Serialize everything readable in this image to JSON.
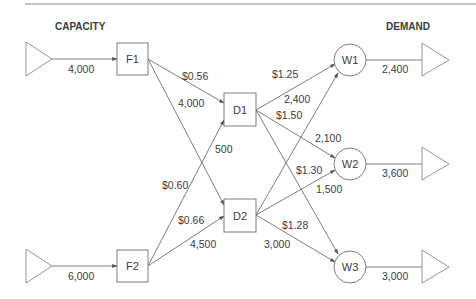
{
  "headers": {
    "capacity": "CAPACITY",
    "demand": "DEMAND"
  },
  "nodes": {
    "F1": "F1",
    "F2": "F2",
    "D1": "D1",
    "D2": "D2",
    "W1": "W1",
    "W2": "W2",
    "W3": "W3"
  },
  "supply": {
    "F1": "4,000",
    "F2": "6,000"
  },
  "demand": {
    "W1": "2,400",
    "W2": "3,600",
    "W3": "3,000"
  },
  "edges": [
    {
      "from": "F1",
      "to": "D1",
      "cost": "$0.56",
      "flow": "4,000"
    },
    {
      "from": "F1",
      "to": "D2",
      "cost": "",
      "flow": ""
    },
    {
      "from": "F2",
      "to": "D1",
      "cost": "$0.60",
      "flow": "500"
    },
    {
      "from": "F2",
      "to": "D2",
      "cost": "$0.66",
      "flow": "4,500"
    },
    {
      "from": "D1",
      "to": "W1",
      "cost": "$1.25",
      "flow": "2,400"
    },
    {
      "from": "D1",
      "to": "W2",
      "cost": "$1.50",
      "flow": "2,100"
    },
    {
      "from": "D1",
      "to": "W3",
      "cost": "",
      "flow": ""
    },
    {
      "from": "D2",
      "to": "W1",
      "cost": "",
      "flow": ""
    },
    {
      "from": "D2",
      "to": "W2",
      "cost": "$1.30",
      "flow": "1,500"
    },
    {
      "from": "D2",
      "to": "W3",
      "cost": "$1.28",
      "flow": "3,000"
    }
  ],
  "colors": {
    "line": "#6f6f6f",
    "text": "#3c3c3c"
  }
}
